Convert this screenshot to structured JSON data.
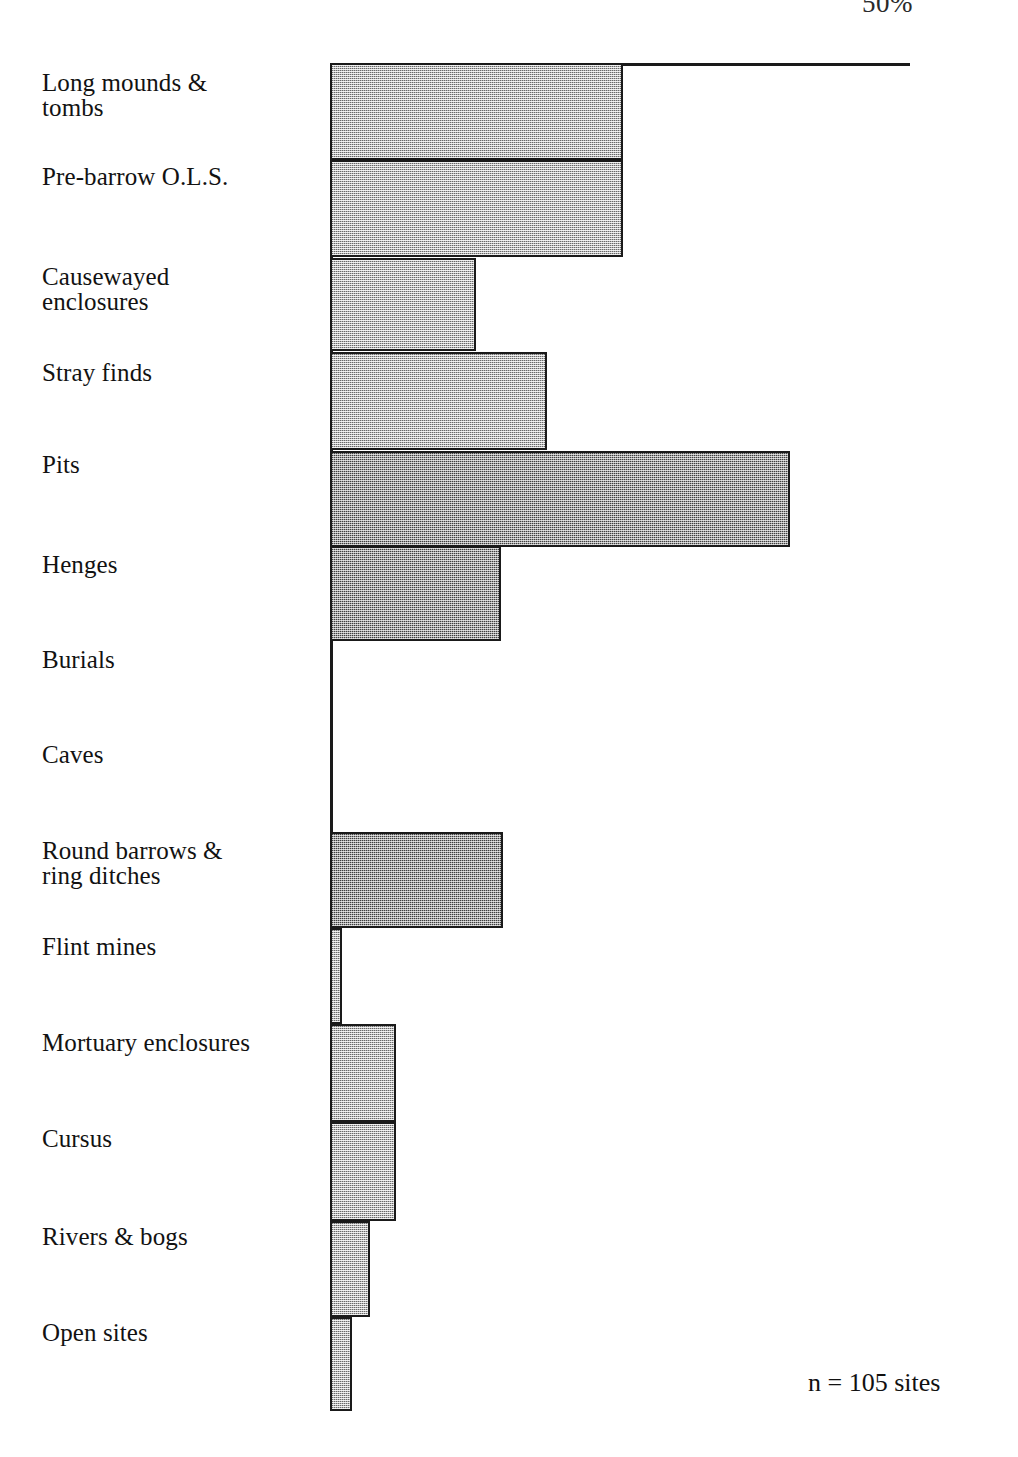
{
  "figure": {
    "sample_size_note": "n = 105 sites",
    "top_axis_label": "50%"
  },
  "chart_data": {
    "type": "bar",
    "orientation": "horizontal",
    "title": "",
    "xlabel": "",
    "ylabel": "",
    "xlim": [
      0,
      100
    ],
    "grid": false,
    "legend": null,
    "annotations": [
      "n = 105 sites",
      "50%"
    ],
    "axis_ticks": [
      "50%"
    ],
    "categories": [
      "Long mounds &\ntombs",
      "Pre-barrow O.L.S.",
      "Causewayed\nenclosures",
      "Stray finds",
      "Pits",
      "Henges",
      "Burials",
      "Caves",
      "Round barrows &\nring ditches",
      "Flint mines",
      "Mortuary enclosures",
      "Cursus",
      "Rivers & bogs",
      "Open sites"
    ],
    "values": [
      50.5,
      50.5,
      25.2,
      37.4,
      79.3,
      29.5,
      0,
      0,
      29.8,
      2.1,
      11.4,
      11.4,
      6.9,
      3.8
    ],
    "bars": [
      {
        "label": "Long mounds & tombs",
        "value": 50.5,
        "top": 63,
        "height": 97,
        "width": 293,
        "shade": "light"
      },
      {
        "label": "Pre-barrow O.L.S.",
        "value": 50.5,
        "top": 160,
        "height": 97,
        "width": 293,
        "shade": "light"
      },
      {
        "label": "Causewayed enclosures",
        "value": 25.2,
        "top": 258,
        "height": 93,
        "width": 146,
        "shade": "light"
      },
      {
        "label": "Stray finds",
        "value": 37.4,
        "top": 352,
        "height": 98,
        "width": 217,
        "shade": "light"
      },
      {
        "label": "Pits",
        "value": 79.3,
        "top": 451,
        "height": 96,
        "width": 460,
        "shade": "dark"
      },
      {
        "label": "Henges",
        "value": 29.5,
        "top": 546,
        "height": 95,
        "width": 171,
        "shade": "dark"
      },
      {
        "label": "Burials",
        "value": 0,
        "top": 641,
        "height": 95,
        "width": 0,
        "shade": "light"
      },
      {
        "label": "Caves",
        "value": 0,
        "top": 736,
        "height": 96,
        "width": 0,
        "shade": "light"
      },
      {
        "label": "Round barrows & ring ditches",
        "value": 29.8,
        "top": 832,
        "height": 96,
        "width": 173,
        "shade": "dark"
      },
      {
        "label": "Flint mines",
        "value": 2.1,
        "top": 928,
        "height": 96,
        "width": 12,
        "shade": "light"
      },
      {
        "label": "Mortuary enclosures",
        "value": 11.4,
        "top": 1024,
        "height": 98,
        "width": 66,
        "shade": "light"
      },
      {
        "label": "Cursus",
        "value": 11.4,
        "top": 1122,
        "height": 99,
        "width": 66,
        "shade": "light"
      },
      {
        "label": "Rivers & bogs",
        "value": 6.9,
        "top": 1221,
        "height": 96,
        "width": 40,
        "shade": "light"
      },
      {
        "label": "Open sites",
        "value": 3.8,
        "top": 1317,
        "height": 94,
        "width": 22,
        "shade": "light"
      }
    ],
    "labels": [
      {
        "text": "Long mounds &\ntombs",
        "top": 70
      },
      {
        "text": "Pre-barrow O.L.S.",
        "top": 164
      },
      {
        "text": "Causewayed\nenclosures",
        "top": 264
      },
      {
        "text": "Stray finds",
        "top": 360
      },
      {
        "text": "Pits",
        "top": 452
      },
      {
        "text": "Henges",
        "top": 552
      },
      {
        "text": "Burials",
        "top": 647
      },
      {
        "text": "Caves",
        "top": 742
      },
      {
        "text": "Round barrows &\nring ditches",
        "top": 838
      },
      {
        "text": "Flint mines",
        "top": 934
      },
      {
        "text": "Mortuary enclosures",
        "top": 1030
      },
      {
        "text": "Cursus",
        "top": 1126
      },
      {
        "text": "Rivers & bogs",
        "top": 1224
      },
      {
        "text": "Open sites",
        "top": 1320
      }
    ]
  },
  "colors": {
    "bar_fill_light": "#b8b8b8",
    "bar_fill_dark": "#a0a0a0",
    "bar_stroke": "#1a1a1a",
    "text": "#111111",
    "background": "#ffffff"
  }
}
